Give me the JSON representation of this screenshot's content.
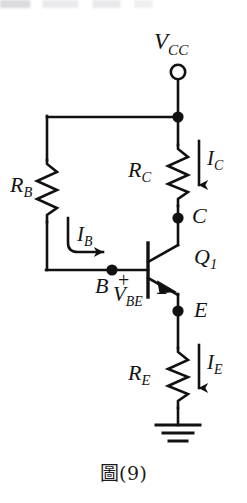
{
  "figure": {
    "caption": "圖(9)",
    "type": "npn-bjt-bias-circuit"
  },
  "nodes": {
    "supply": {
      "label": "V",
      "sub": "CC",
      "terminal": "open-circle"
    },
    "collector": {
      "label": "C"
    },
    "base": {
      "label": "B"
    },
    "emitter": {
      "label": "E"
    },
    "transistor": {
      "label": "Q",
      "sub": "1",
      "device": "npn-transistor"
    },
    "ground": {
      "symbol": "earth-ground"
    }
  },
  "components": [
    {
      "name": "base-resistor",
      "label": "R",
      "sub": "B",
      "symbol": "zigzag-resistor"
    },
    {
      "name": "collector-resistor",
      "label": "R",
      "sub": "C",
      "symbol": "zigzag-resistor"
    },
    {
      "name": "emitter-resistor",
      "label": "R",
      "sub": "E",
      "symbol": "zigzag-resistor"
    }
  ],
  "currents": [
    {
      "name": "base-current",
      "label": "I",
      "sub": "B",
      "direction": "right"
    },
    {
      "name": "collector-current",
      "label": "I",
      "sub": "C",
      "direction": "down"
    },
    {
      "name": "emitter-current",
      "label": "I",
      "sub": "E",
      "direction": "down"
    }
  ],
  "voltages": [
    {
      "name": "base-emitter-voltage",
      "label": "V",
      "sub": "BE",
      "plus": "+",
      "minus": "−"
    }
  ],
  "colors": {
    "wire": "#111111",
    "text": "#141414",
    "background": "#ffffff"
  }
}
